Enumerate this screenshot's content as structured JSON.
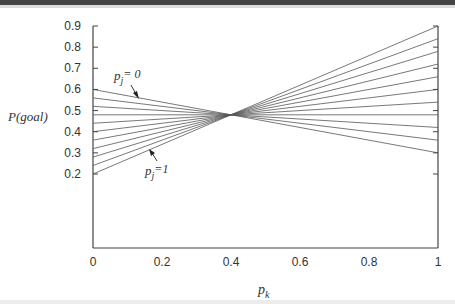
{
  "chart_data": {
    "type": "line",
    "title": "",
    "xlabel": "p_k",
    "ylabel": "P(goal)",
    "xlim": [
      0,
      1
    ],
    "ylim": [
      -0.15,
      0.9
    ],
    "grid": false,
    "legend": null,
    "x_ticks": [
      "0",
      "0.2",
      "0.4",
      "0.6",
      "0.8",
      "1"
    ],
    "y_ticks": [
      "0.9",
      "0.8",
      "0.7",
      "0.6",
      "0.5",
      "0.4",
      "0.3",
      "0.2"
    ],
    "x": [
      0,
      1
    ],
    "series": [
      {
        "name": "p_j=0",
        "values": [
          0.6,
          0.3
        ]
      },
      {
        "name": "p_j=0.1",
        "values": [
          0.56,
          0.36
        ]
      },
      {
        "name": "p_j=0.2",
        "values": [
          0.52,
          0.42
        ]
      },
      {
        "name": "p_j=0.3",
        "values": [
          0.48,
          0.48
        ]
      },
      {
        "name": "p_j=0.4",
        "values": [
          0.44,
          0.54
        ]
      },
      {
        "name": "p_j=0.5",
        "values": [
          0.4,
          0.6
        ]
      },
      {
        "name": "p_j=0.6",
        "values": [
          0.36,
          0.66
        ]
      },
      {
        "name": "p_j=0.7",
        "values": [
          0.32,
          0.72
        ]
      },
      {
        "name": "p_j=0.8",
        "values": [
          0.28,
          0.78
        ]
      },
      {
        "name": "p_j=0.9",
        "values": [
          0.24,
          0.84
        ]
      },
      {
        "name": "p_j=1",
        "values": [
          0.2,
          0.9
        ]
      }
    ],
    "intersection": {
      "x": 0.4,
      "y": 0.48
    },
    "annotations": [
      {
        "text": "p_j = 0",
        "points_to_series": "p_j=0"
      },
      {
        "text": "p_j = 1",
        "points_to_series": "p_j=1"
      }
    ]
  },
  "labels": {
    "ylabel": "P(goal)",
    "xlabel_main": "p",
    "xlabel_sub": "k",
    "ann_top_main": "p",
    "ann_top_sub": "j",
    "ann_top_rest": "= 0",
    "ann_bot_main": "p",
    "ann_bot_sub": "j",
    "ann_bot_rest": "=1"
  }
}
